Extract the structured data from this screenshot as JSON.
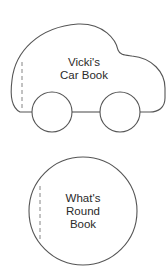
{
  "books": [
    {
      "shape": "car",
      "title_lines": [
        "Vicki's",
        "Car Book"
      ]
    },
    {
      "shape": "circle",
      "title_lines": [
        "What's",
        "Round",
        "Book"
      ]
    }
  ],
  "colors": {
    "stroke": "#555555",
    "text": "#2a2a2a",
    "background": "#ffffff"
  }
}
